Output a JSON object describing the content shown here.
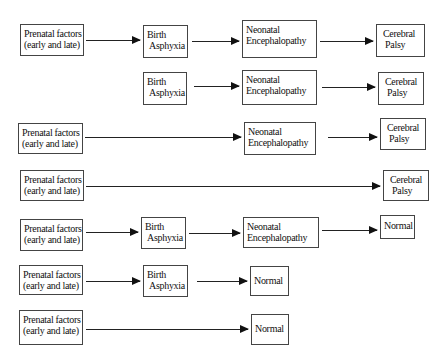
{
  "diagram": {
    "type": "flow-pathways",
    "labels": {
      "prenatal": [
        "Prenatal factors",
        "(early and late)"
      ],
      "birth": [
        "Birth",
        "Asphyxia"
      ],
      "neonatal": [
        "Neonatal",
        "Encephalopathy"
      ],
      "cp": [
        "Cerebral",
        "Palsy"
      ],
      "normal": [
        "Normal"
      ]
    },
    "rows": [
      {
        "nodes": [
          {
            "kind": "prenatal",
            "x": 20,
            "y": 24,
            "w": 64,
            "h": 32
          },
          {
            "kind": "birth",
            "x": 143,
            "y": 25,
            "w": 45,
            "h": 33
          },
          {
            "kind": "neonatal",
            "x": 242,
            "y": 20,
            "w": 75,
            "h": 38
          },
          {
            "kind": "cp",
            "x": 376,
            "y": 24,
            "w": 49,
            "h": 33
          }
        ],
        "arrows": [
          {
            "x1": 86,
            "x2": 140,
            "y": 40
          },
          {
            "x1": 192,
            "x2": 239,
            "y": 41
          },
          {
            "x1": 320,
            "x2": 373,
            "y": 41
          }
        ]
      },
      {
        "nodes": [
          {
            "kind": "birth",
            "x": 143,
            "y": 72,
            "w": 44,
            "h": 33
          },
          {
            "kind": "neonatal",
            "x": 242,
            "y": 70,
            "w": 75,
            "h": 35
          },
          {
            "kind": "cp",
            "x": 378,
            "y": 72,
            "w": 46,
            "h": 33
          }
        ],
        "arrows": [
          {
            "x1": 194,
            "x2": 239,
            "y": 86
          },
          {
            "x1": 322,
            "x2": 375,
            "y": 87
          }
        ]
      },
      {
        "nodes": [
          {
            "kind": "prenatal",
            "x": 18,
            "y": 123,
            "w": 65,
            "h": 31
          },
          {
            "kind": "neonatal",
            "x": 244,
            "y": 122,
            "w": 72,
            "h": 33
          },
          {
            "kind": "cp",
            "x": 380,
            "y": 118,
            "w": 46,
            "h": 32
          }
        ],
        "arrows": [
          {
            "x1": 85,
            "x2": 241,
            "y": 137
          },
          {
            "x1": 328,
            "x2": 377,
            "y": 137
          }
        ]
      },
      {
        "nodes": [
          {
            "kind": "prenatal",
            "x": 20,
            "y": 170,
            "w": 64,
            "h": 31
          },
          {
            "kind": "cp",
            "x": 383,
            "y": 170,
            "w": 46,
            "h": 31
          }
        ],
        "arrows": [
          {
            "x1": 86,
            "x2": 380,
            "y": 186
          }
        ]
      },
      {
        "nodes": [
          {
            "kind": "prenatal",
            "x": 20,
            "y": 219,
            "w": 63,
            "h": 32
          },
          {
            "kind": "birth",
            "x": 141,
            "y": 217,
            "w": 45,
            "h": 32
          },
          {
            "kind": "neonatal",
            "x": 243,
            "y": 217,
            "w": 76,
            "h": 31
          },
          {
            "kind": "normal",
            "x": 380,
            "y": 215,
            "w": 35,
            "h": 24
          }
        ],
        "arrows": [
          {
            "x1": 86,
            "x2": 138,
            "y": 232
          },
          {
            "x1": 189,
            "x2": 240,
            "y": 233
          },
          {
            "x1": 322,
            "x2": 377,
            "y": 230
          }
        ]
      },
      {
        "nodes": [
          {
            "kind": "prenatal",
            "x": 19,
            "y": 265,
            "w": 64,
            "h": 30
          },
          {
            "kind": "birth",
            "x": 143,
            "y": 265,
            "w": 45,
            "h": 32
          },
          {
            "kind": "normal",
            "x": 250,
            "y": 266,
            "w": 39,
            "h": 30
          }
        ],
        "arrows": [
          {
            "x1": 86,
            "x2": 140,
            "y": 281
          },
          {
            "x1": 197,
            "x2": 247,
            "y": 281
          }
        ]
      },
      {
        "nodes": [
          {
            "kind": "prenatal",
            "x": 19,
            "y": 310,
            "w": 64,
            "h": 35
          },
          {
            "kind": "normal",
            "x": 251,
            "y": 314,
            "w": 38,
            "h": 31
          }
        ],
        "arrows": [
          {
            "x1": 86,
            "x2": 248,
            "y": 329
          }
        ]
      }
    ]
  }
}
